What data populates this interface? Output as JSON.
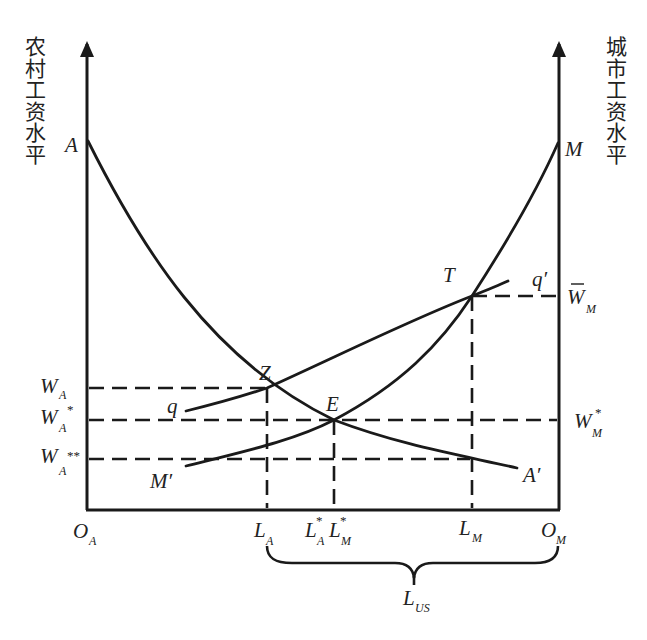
{
  "axes": {
    "left_axis_label": "农村工资水平",
    "right_axis_label": "城市工资水平",
    "origin_left": {
      "main": "O",
      "sub": "A"
    },
    "origin_right": {
      "main": "O",
      "sub": "M"
    }
  },
  "curves": {
    "rural_demand": {
      "start_label": "A",
      "end_label": "A′"
    },
    "urban_demand": {
      "start_label": "M′",
      "end_label": "M"
    },
    "qq_curve": {
      "start_label": "q",
      "end_label": "q′"
    }
  },
  "points": {
    "Z": "Z",
    "E": "E",
    "T": "T"
  },
  "wage_labels": {
    "wa": {
      "main": "W",
      "sub": "A",
      "sup": ""
    },
    "wa_star": {
      "main": "W",
      "sub": "A",
      "sup": "*"
    },
    "wa_double_star": {
      "main": "W",
      "sub": "A",
      "sup": "**"
    },
    "wm_bar": {
      "main": "W",
      "sub": "M",
      "bar": "‾"
    },
    "wm_star": {
      "main": "W",
      "sub": "M",
      "sup": "*"
    }
  },
  "labor_labels": {
    "la": {
      "main": "L",
      "sub": "A"
    },
    "la_star": {
      "main": "L",
      "sub": "A",
      "sup": "*"
    },
    "lm_star": {
      "main": "L",
      "sub": "M",
      "sup": "*"
    },
    "lm": {
      "main": "L",
      "sub": "M"
    },
    "lus": {
      "main": "L",
      "sub": "US"
    }
  },
  "colors": {
    "ink": "#1a1a1a",
    "background": "#ffffff"
  }
}
